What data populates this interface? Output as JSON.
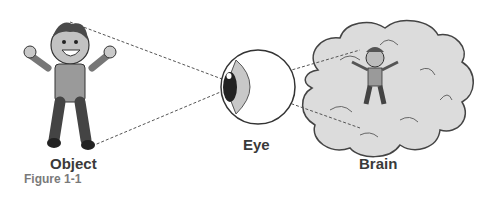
{
  "figure": {
    "caption": "Figure 1-1",
    "labels": {
      "object": "Object",
      "eye": "Eye",
      "brain": "Brain"
    }
  },
  "colors": {
    "line": "#555555",
    "brain_fill": "#d8d8d8",
    "outline": "#333333",
    "caption": "#7a7a7a"
  }
}
